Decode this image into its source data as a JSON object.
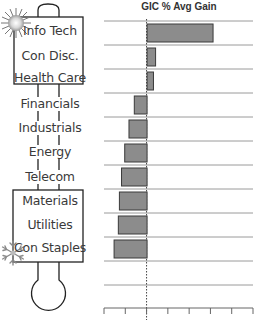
{
  "thermometer": {
    "hot_icon": "sunburst-icon",
    "cold_icon": "snowflake-icon",
    "labels": [
      "Info Tech",
      "Con Disc.",
      "Health Care",
      "Financials",
      "Industrials",
      "Energy",
      "Telecom",
      "Materials",
      "Utilities",
      "Con Staples"
    ]
  },
  "chart_data": {
    "type": "bar",
    "orientation": "horizontal",
    "title": "GIC % Avg Gain",
    "xlabel": "",
    "ylabel": "",
    "categories": [
      "Info Tech",
      "Con Disc.",
      "Health Care",
      "Financials",
      "Industrials",
      "Energy",
      "Telecom",
      "Materials",
      "Utilities",
      "Con Staples"
    ],
    "values": [
      3.1,
      0.4,
      0.3,
      -0.6,
      -0.85,
      -1.05,
      -1.2,
      -1.3,
      -1.35,
      -1.55
    ],
    "units_note": "relative units; one axis tick interval = 1 (tick labels not shown)",
    "xlim": [
      -2,
      5
    ],
    "x_ticks": [
      -2,
      -1,
      0,
      1,
      2,
      3,
      4,
      5
    ],
    "grid": true,
    "empty_rows_below": 2,
    "colors": {
      "bar_fill": "#8c8c8c",
      "bar_stroke": "#3a3a3a",
      "grid": "#9a9a9a",
      "zero_line": "#444444"
    }
  }
}
